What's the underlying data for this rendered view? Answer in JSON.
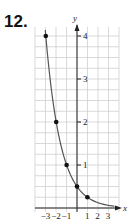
{
  "problem_number": "12.",
  "chart_data": {
    "type": "line",
    "title": "",
    "xlabel": "x",
    "ylabel": "y",
    "x": [
      -3,
      -2,
      -1,
      0,
      1
    ],
    "values": [
      4,
      2,
      1,
      0.5,
      0.25
    ],
    "curve": "y = (1/2)^(x+1)",
    "xlim": [
      -3,
      3
    ],
    "ylim": [
      0,
      4
    ],
    "x_ticks": [
      "-3",
      "-2",
      "-1",
      "1",
      "2",
      "3"
    ],
    "y_ticks": [
      "1",
      "2",
      "3",
      "4"
    ],
    "grid": true,
    "colors": {
      "curve": "#555555",
      "points": "#111111",
      "grid": "#c8c8c8"
    }
  }
}
